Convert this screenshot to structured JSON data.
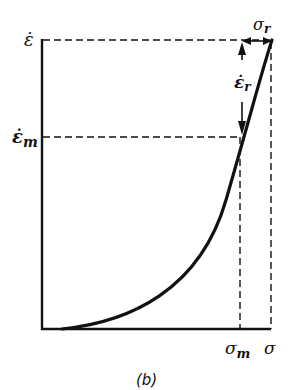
{
  "figure": {
    "caption": "(b)",
    "y_axis_label_top": "ε̇",
    "y_axis_label_mid": "ε̇",
    "y_axis_label_mid_sub": "m",
    "x_axis_label_m": "σ",
    "x_axis_label_m_sub": "m",
    "x_axis_label_end": "σ",
    "relax_stress_label": "σ",
    "relax_stress_sub": "r",
    "relax_strain_label": "ε̇",
    "relax_strain_sub": "r"
  },
  "colors": {
    "ink": "#111111",
    "background": "#ffffff"
  }
}
